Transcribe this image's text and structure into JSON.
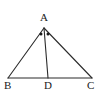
{
  "figure": {
    "type": "geometry-diagram",
    "stroke_color": "#2b2b2b",
    "background_color": "#ffffff",
    "label_color": "#1a1a1a",
    "points": {
      "A": {
        "label": "A",
        "x": 44,
        "y": 28
      },
      "B": {
        "label": "B",
        "x": 8,
        "y": 78
      },
      "C": {
        "label": "C",
        "x": 92,
        "y": 78
      },
      "D": {
        "label": "D",
        "x": 48,
        "y": 78
      }
    },
    "segments": [
      {
        "name": "AB",
        "from": "A",
        "to": "B"
      },
      {
        "name": "AC",
        "from": "A",
        "to": "C"
      },
      {
        "name": "BC",
        "from": "B",
        "to": "C"
      },
      {
        "name": "AD",
        "from": "A",
        "to": "D"
      }
    ],
    "angle_marks": [
      {
        "name": "angle-BAD-dot",
        "glyph": "dot",
        "x": 41,
        "y": 33
      },
      {
        "name": "angle-DAC-dot",
        "glyph": "dot",
        "x": 48,
        "y": 33
      }
    ]
  }
}
